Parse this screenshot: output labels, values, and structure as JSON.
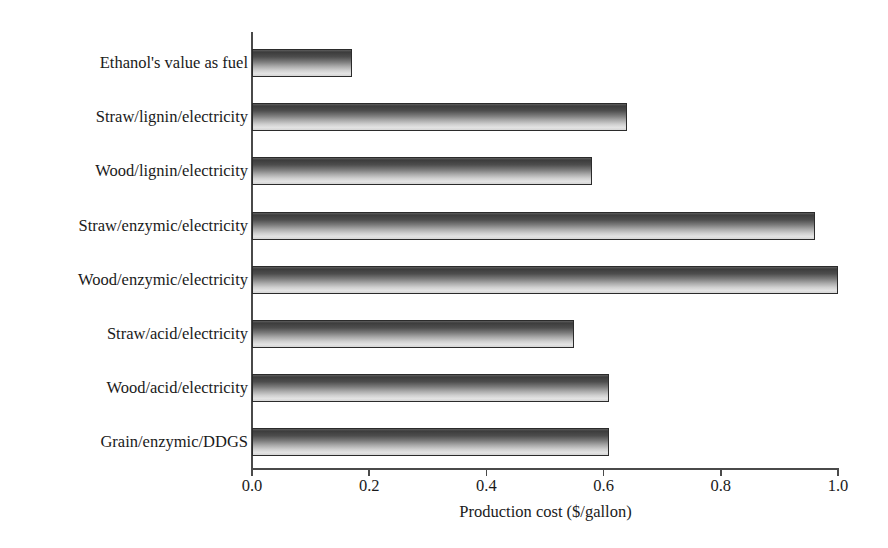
{
  "chart_data": {
    "type": "bar",
    "orientation": "horizontal",
    "title": "",
    "xlabel": "Production cost ($/gallon)",
    "ylabel": "",
    "xlim": [
      0.0,
      1.0
    ],
    "xticks": [
      "0.0",
      "0.2",
      "0.4",
      "0.6",
      "0.8",
      "1.0"
    ],
    "xtick_values": [
      0.0,
      0.2,
      0.4,
      0.6,
      0.8,
      1.0
    ],
    "grid": false,
    "legend": null,
    "categories": [
      "Ethanol's value as fuel",
      "Straw/lignin/electricity",
      "Wood/lignin/electricity",
      "Straw/enzymic/electricity",
      "Wood/enzymic/electricity",
      "Straw/acid/electricity",
      "Wood/acid/electricity",
      "Grain/enzymic/DDGS"
    ],
    "values": [
      0.17,
      0.64,
      0.58,
      0.96,
      1.0,
      0.55,
      0.61,
      0.61
    ],
    "bar_fill_top_color": "#3c3c3c",
    "bar_fill_bottom_color": "#e3e3e3",
    "bar_border_color": "#2b2b2b",
    "axis_color": "#4a4a4a"
  }
}
